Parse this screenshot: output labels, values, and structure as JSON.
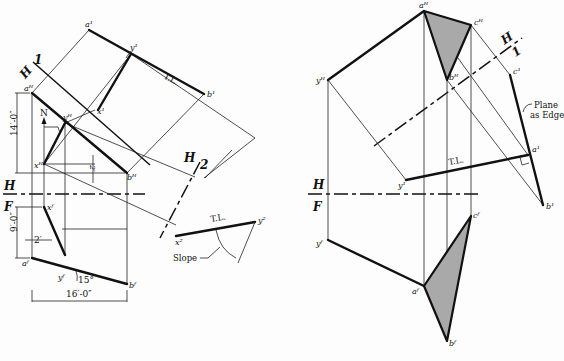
{
  "figure": {
    "left": {
      "points": {
        "a1": "a¹",
        "b1": "b¹",
        "y1": "y¹",
        "x1": "x¹",
        "aH": "aᴴ",
        "bH": "bᴴ",
        "xH": "xᴴ",
        "yH": "yᴴ",
        "aF": "aᶠ",
        "bF": "bᶠ",
        "xF": "xᶠ",
        "yF": "yᶠ",
        "x2": "x²",
        "y2": "y²"
      },
      "fold_lines": {
        "H": "H",
        "F": "F",
        "H1_h": "H",
        "H1_n": "1",
        "H2_h": "H",
        "H2_n": "2"
      },
      "labels": {
        "tl1": "T.L.",
        "tl2": "T.L.",
        "north": "N",
        "slope": "Slope"
      },
      "dimensions": {
        "height_h": "14′-0″",
        "height_f": "9′-0″",
        "width": "16′-0″",
        "offset": "2′",
        "small": "2′",
        "angle": "15°"
      }
    },
    "right": {
      "points": {
        "aH": "aᴴ",
        "bH": "bᴴ",
        "cH": "cᴴ",
        "yH": "yᴴ",
        "a1": "a¹",
        "b1": "b¹",
        "c1": "c¹",
        "y1": "y¹",
        "aF": "aᶠ",
        "bF": "bᶠ",
        "cF": "cᶠ",
        "yF": "yᶠ"
      },
      "fold_lines": {
        "H": "H",
        "F": "F",
        "H1_h": "H",
        "H1_n": "1"
      },
      "labels": {
        "tl": "T.L.",
        "plane_edge_1": "Plane",
        "plane_edge_2": "as Edge"
      }
    },
    "colors": {
      "ink": "#111111",
      "shade": "#a9a9a9",
      "paper": "#fdfdfd"
    }
  }
}
